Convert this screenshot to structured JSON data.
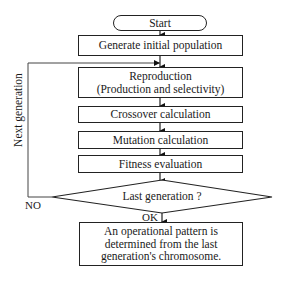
{
  "flowchart": {
    "start": "Start",
    "steps": [
      {
        "id": "generate",
        "label": "Generate initial population"
      },
      {
        "id": "reproduction",
        "line1": "Reproduction",
        "line2": "(Production and selectivity)"
      },
      {
        "id": "crossover",
        "label": "Crossover calculation"
      },
      {
        "id": "mutation",
        "label": "Mutation calculation"
      },
      {
        "id": "fitness",
        "label": "Fitness evaluation"
      }
    ],
    "decision": {
      "label": "Last generation ?",
      "no_label": "NO",
      "yes_label": "OK"
    },
    "loop_label": "Next generation",
    "end": {
      "line1": "An operational pattern is",
      "line2": "determined from the last",
      "line3": "generation's chromosome."
    }
  },
  "colors": {
    "line": "#222222",
    "background": "#ffffff"
  }
}
